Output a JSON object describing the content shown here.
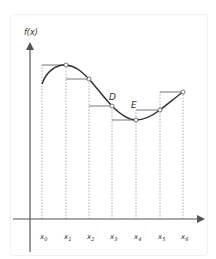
{
  "diagram": {
    "y_axis_label": "f(x)",
    "point_labels": {
      "D": "D",
      "E": "E"
    },
    "x_ticks": [
      {
        "base": "x",
        "sub": "0",
        "px": 42
      },
      {
        "base": "x",
        "sub": "1",
        "px": 66
      },
      {
        "base": "x",
        "sub": "2",
        "px": 89
      },
      {
        "base": "x",
        "sub": "3",
        "px": 112
      },
      {
        "base": "x",
        "sub": "4",
        "px": 136
      },
      {
        "base": "x",
        "sub": "5",
        "px": 160
      },
      {
        "base": "x",
        "sub": "6",
        "px": 183
      }
    ],
    "colors": {
      "axis": "#555555",
      "curve": "#333333",
      "step": "#666666",
      "dotted": "#999999",
      "point_fill": "#ffffff"
    }
  }
}
